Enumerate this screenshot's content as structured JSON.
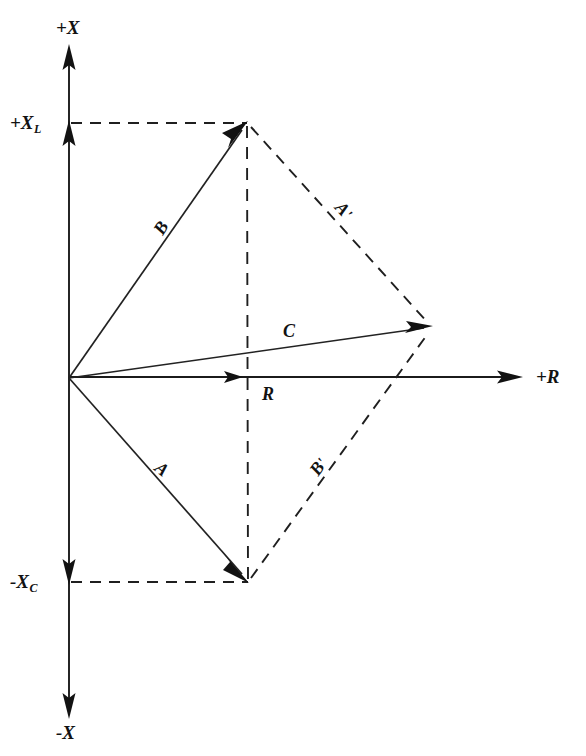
{
  "figure": {
    "type": "vector-phasor-diagram",
    "background_color": "#ffffff",
    "ink_color": "#121212"
  },
  "axes": {
    "vertical": {
      "name": "reactance-axis",
      "positive_label": "+X",
      "negative_label": "-X",
      "x_px": 69,
      "top_tip_y": 45,
      "bottom_tip_y": 718
    },
    "horizontal": {
      "name": "resistance-axis",
      "positive_label": "+R",
      "y_px": 377,
      "origin_x": 69,
      "tip_x": 522
    },
    "ticks": [
      {
        "id": "inductive-reactance-tick",
        "label_main": "+X",
        "label_sub": "L",
        "y_px": 123,
        "arrow_direction": "up"
      },
      {
        "id": "capacitive-reactance-tick",
        "label_main": "-X",
        "label_sub": "C",
        "y_px": 582,
        "arrow_direction": "down"
      }
    ]
  },
  "origin": {
    "x": 69,
    "y": 378
  },
  "vectors": [
    {
      "id": "vector-b",
      "label": "B",
      "style": "solid",
      "from": {
        "x": 69,
        "y": 378
      },
      "to": {
        "x": 247,
        "y": 123
      },
      "label_pos": {
        "x": 150,
        "y": 228
      },
      "rotation_deg": -58
    },
    {
      "id": "vector-a",
      "label": "A",
      "style": "solid",
      "from": {
        "x": 69,
        "y": 378
      },
      "to": {
        "x": 248,
        "y": 582
      },
      "label_pos": {
        "x": 163,
        "y": 458
      },
      "rotation_deg": 39
    },
    {
      "id": "vector-c",
      "label": "C",
      "style": "solid",
      "from": {
        "x": 69,
        "y": 378
      },
      "to": {
        "x": 432,
        "y": 327
      },
      "label_pos": {
        "x": 283,
        "y": 322
      },
      "rotation_deg": 0
    },
    {
      "id": "vector-r",
      "label": "R",
      "style": "solid",
      "from": {
        "x": 69,
        "y": 377
      },
      "to": {
        "x": 243,
        "y": 377
      },
      "label_pos": {
        "x": 262,
        "y": 385
      },
      "rotation_deg": 0
    },
    {
      "id": "vector-a-prime",
      "label": "A",
      "prime": "'",
      "style": "dashed",
      "from": {
        "x": 247,
        "y": 123
      },
      "to": {
        "x": 432,
        "y": 327
      },
      "label_pos": {
        "x": 345,
        "y": 198
      },
      "rotation_deg": 47
    },
    {
      "id": "vector-b-prime",
      "label": "B",
      "prime": "'",
      "style": "dashed",
      "from": {
        "x": 248,
        "y": 582
      },
      "to": {
        "x": 432,
        "y": 327
      },
      "label_pos": {
        "x": 306,
        "y": 468
      },
      "rotation_deg": -54
    }
  ],
  "construction_lines": [
    {
      "id": "upper-projection-line",
      "from": {
        "x": 69,
        "y": 123
      },
      "to": {
        "x": 247,
        "y": 123
      }
    },
    {
      "id": "lower-projection-line",
      "from": {
        "x": 69,
        "y": 582
      },
      "to": {
        "x": 248,
        "y": 582
      }
    },
    {
      "id": "vertical-resultant-line",
      "from": {
        "x": 247,
        "y": 123
      },
      "to": {
        "x": 248,
        "y": 582
      }
    }
  ]
}
